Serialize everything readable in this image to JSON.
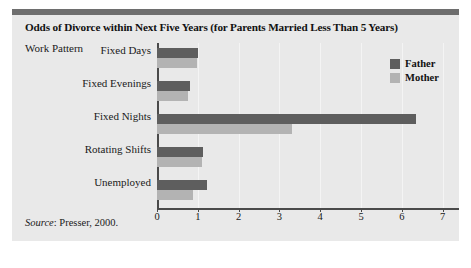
{
  "figure": {
    "title": "Odds of Divorce within Next Five Years (for Parents Married Less Than 5 Years)",
    "axis_caption": "Work Pattern",
    "source": "Source",
    "source_text": ": Presser, 2000.",
    "caption": "",
    "colors": {
      "father": "#5e5e5e",
      "mother": "#b3b3b3",
      "panel_background": "#e9e9e9",
      "top_rule": "#6e6e6e",
      "axis": "#4a4a4a"
    }
  },
  "legend": {
    "position": "top-right",
    "entries": [
      {
        "label": "Father",
        "color": "#5e5e5e"
      },
      {
        "label": "Mother",
        "color": "#b3b3b3"
      }
    ]
  },
  "chart_data": {
    "type": "bar",
    "orientation": "horizontal",
    "title": "Odds of Divorce within Next Five Years (for Parents Married Less Than 5 Years)",
    "xlabel": "",
    "ylabel": "Work Pattern",
    "xlim": [
      0,
      7.4
    ],
    "xticks": [
      0,
      1,
      2,
      3,
      4,
      5,
      6,
      7
    ],
    "xtick_labels": [
      "0",
      "1",
      "2",
      "3",
      "4",
      "5",
      "6",
      "7"
    ],
    "grid": true,
    "categories": [
      "Fixed Days",
      "Fixed Evenings",
      "Fixed Nights",
      "Rotating Shifts",
      "Unemployed"
    ],
    "series": [
      {
        "name": "Father",
        "color": "#5e5e5e",
        "values": [
          1.0,
          0.82,
          6.35,
          1.12,
          1.23
        ]
      },
      {
        "name": "Mother",
        "color": "#b3b3b3",
        "values": [
          0.97,
          0.77,
          3.3,
          1.1,
          0.87
        ]
      }
    ],
    "source": "Source: Presser, 2000."
  }
}
